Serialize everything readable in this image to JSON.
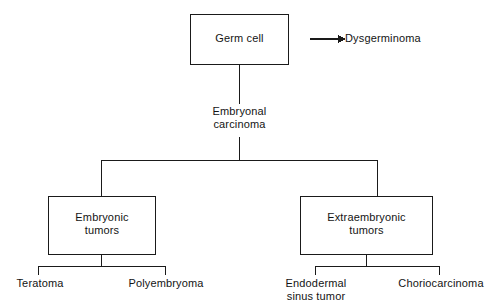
{
  "diagram": {
    "background_color": "#ffffff",
    "line_color": "#1a1a1a",
    "text_color": "#141414",
    "nodes": {
      "germ_cell": "Germ cell",
      "dysgerminoma": "Dysgerminoma",
      "embryonal_carcinoma": "Embryonal\ncarcinoma",
      "embryonic_tumors": "Embryonic\ntumors",
      "extraembryonic_tumors": "Extraembryonic\ntumors",
      "teratoma": "Teratoma",
      "polyembryoma": "Polyembryoma",
      "endodermal_sinus_tumor": "Endodermal\nsinus tumor",
      "choriocarcinoma": "Choriocarcinoma"
    }
  }
}
